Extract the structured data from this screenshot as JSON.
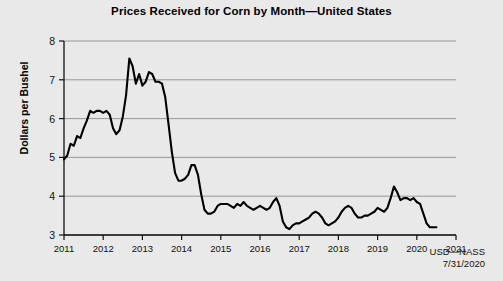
{
  "chart_data": {
    "type": "line",
    "title": "Prices Received for Corn by Month—United States",
    "xlabel": "",
    "ylabel": "Dollars per Bushel",
    "ylim": [
      3,
      8
    ],
    "xlim": [
      2011,
      2021
    ],
    "yticks": [
      3,
      4,
      5,
      6,
      7,
      8
    ],
    "xticks": [
      "2011",
      "2012",
      "2013",
      "2014",
      "2015",
      "2016",
      "2017",
      "2018",
      "2019",
      "2020",
      "2021"
    ],
    "grid": "horizontal",
    "legend": "none",
    "line_color": "#000000",
    "series": [
      {
        "name": "Corn price received",
        "x": [
          2011.0,
          2011.083,
          2011.167,
          2011.25,
          2011.333,
          2011.417,
          2011.5,
          2011.583,
          2011.667,
          2011.75,
          2011.833,
          2011.917,
          2012.0,
          2012.083,
          2012.167,
          2012.25,
          2012.333,
          2012.417,
          2012.5,
          2012.583,
          2012.667,
          2012.75,
          2012.833,
          2012.917,
          2013.0,
          2013.083,
          2013.167,
          2013.25,
          2013.333,
          2013.417,
          2013.5,
          2013.583,
          2013.667,
          2013.75,
          2013.833,
          2013.917,
          2014.0,
          2014.083,
          2014.167,
          2014.25,
          2014.333,
          2014.417,
          2014.5,
          2014.583,
          2014.667,
          2014.75,
          2014.833,
          2014.917,
          2015.0,
          2015.083,
          2015.167,
          2015.25,
          2015.333,
          2015.417,
          2015.5,
          2015.583,
          2015.667,
          2015.75,
          2015.833,
          2015.917,
          2016.0,
          2016.083,
          2016.167,
          2016.25,
          2016.333,
          2016.417,
          2016.5,
          2016.583,
          2016.667,
          2016.75,
          2016.833,
          2016.917,
          2017.0,
          2017.083,
          2017.167,
          2017.25,
          2017.333,
          2017.417,
          2017.5,
          2017.583,
          2017.667,
          2017.75,
          2017.833,
          2017.917,
          2018.0,
          2018.083,
          2018.167,
          2018.25,
          2018.333,
          2018.417,
          2018.5,
          2018.583,
          2018.667,
          2018.75,
          2018.833,
          2018.917,
          2019.0,
          2019.083,
          2019.167,
          2019.25,
          2019.333,
          2019.417,
          2019.5,
          2019.583,
          2019.667,
          2019.75,
          2019.833,
          2019.917,
          2020.0,
          2020.083,
          2020.167,
          2020.25,
          2020.333,
          2020.417,
          2020.5
        ],
        "values": [
          4.95,
          5.05,
          5.35,
          5.3,
          5.55,
          5.5,
          5.75,
          5.95,
          6.2,
          6.15,
          6.2,
          6.2,
          6.15,
          6.2,
          6.1,
          5.75,
          5.6,
          5.7,
          6.05,
          6.6,
          7.55,
          7.35,
          6.9,
          7.15,
          6.85,
          6.95,
          7.2,
          7.15,
          6.95,
          6.95,
          6.9,
          6.55,
          5.85,
          5.15,
          4.6,
          4.4,
          4.4,
          4.45,
          4.55,
          4.8,
          4.8,
          4.55,
          4.05,
          3.65,
          3.55,
          3.55,
          3.6,
          3.75,
          3.8,
          3.8,
          3.8,
          3.75,
          3.7,
          3.8,
          3.75,
          3.85,
          3.75,
          3.7,
          3.65,
          3.7,
          3.75,
          3.7,
          3.65,
          3.7,
          3.85,
          3.95,
          3.75,
          3.35,
          3.2,
          3.15,
          3.25,
          3.3,
          3.3,
          3.35,
          3.4,
          3.45,
          3.55,
          3.6,
          3.55,
          3.45,
          3.3,
          3.25,
          3.3,
          3.35,
          3.45,
          3.6,
          3.7,
          3.75,
          3.7,
          3.55,
          3.45,
          3.45,
          3.5,
          3.5,
          3.55,
          3.6,
          3.7,
          3.65,
          3.6,
          3.7,
          3.95,
          4.25,
          4.1,
          3.9,
          3.95,
          3.95,
          3.9,
          3.95,
          3.85,
          3.8,
          3.55,
          3.3,
          3.2,
          3.2,
          3.2
        ]
      }
    ],
    "footer_source": "USD—NASS",
    "footer_date": "7/31/2020"
  },
  "axis": {
    "y_title": "Dollars per Bushel"
  }
}
